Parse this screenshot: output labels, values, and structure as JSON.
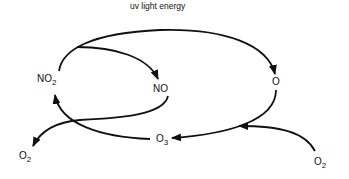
{
  "diagram": {
    "title": "uv light energy",
    "colors": {
      "stroke": "#111111",
      "background": "#ffffff"
    },
    "nodes": [
      {
        "id": "no2",
        "base": "NO",
        "sub": "2"
      },
      {
        "id": "no",
        "base": "NO",
        "sub": ""
      },
      {
        "id": "o",
        "base": "O",
        "sub": ""
      },
      {
        "id": "o3",
        "base": "O",
        "sub": "3"
      },
      {
        "id": "o2_left",
        "base": "O",
        "sub": "2"
      },
      {
        "id": "o2_right",
        "base": "O",
        "sub": "2"
      }
    ],
    "edges": [
      {
        "from": "NO2",
        "to": "O",
        "label": "uv light energy"
      },
      {
        "from": "NO2",
        "to": "NO"
      },
      {
        "from": "NO",
        "to": "O2 (left)"
      },
      {
        "from": "O3",
        "to": "NO2"
      },
      {
        "from": "O",
        "to": "O3"
      },
      {
        "from": "O2 (right)",
        "to": "O3"
      }
    ]
  }
}
